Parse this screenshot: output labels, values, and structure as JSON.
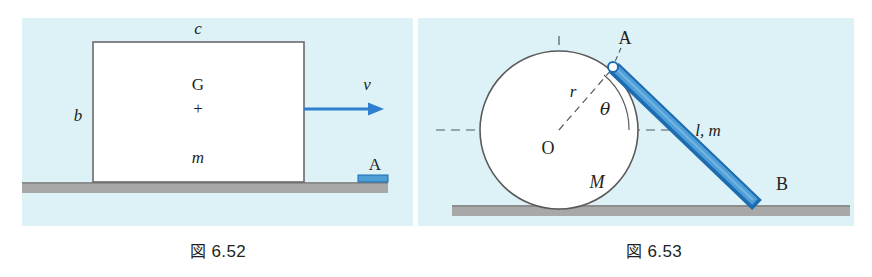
{
  "page": {
    "background_color": "#ffffff",
    "panel_background_color": "#ddf2f7",
    "ground_color": "#a8a8a8",
    "ground_edge_color": "#7d7d7d",
    "accent_blue": "#2e7fd0",
    "rod_blue_light": "#4e9fd8",
    "rod_blue_dark": "#1d6bb0",
    "outline_color": "#555555",
    "text_color": "#231f20"
  },
  "figures": [
    {
      "id": "figure-6-52",
      "caption_kanji": "図",
      "caption_number": "6.52",
      "description": "Rectangular block of mass m sliding on ground toward a small stop A",
      "labels": {
        "top_width": "c",
        "left_height": "b",
        "centroid": "G",
        "centroid_marker": "+",
        "mass": "m",
        "velocity": "v",
        "stop": "A"
      }
    },
    {
      "id": "figure-6-53",
      "caption_kanji": "図",
      "caption_number": "6.53",
      "description": "Circle of mass M resting on ground with a rod AB pinned at A on the circle, end B on the ground",
      "labels": {
        "pivot": "A",
        "center": "O",
        "radius": "r",
        "angle": "θ",
        "disk_mass": "M",
        "rod": "l, m",
        "rod_end": "B"
      }
    }
  ],
  "geometry": {
    "figure_6_52": {
      "block": {
        "x": 71,
        "y": 41,
        "width": 211,
        "height": 139
      },
      "arrow": {
        "x1": 282,
        "y1": 108,
        "x2": 352,
        "y2": 108
      },
      "stop_block": {
        "x": 357,
        "y": 174,
        "width": 29,
        "height": 7
      },
      "ground": {
        "x": 8,
        "y": 181,
        "width": 380,
        "height": 11
      }
    },
    "figure_6_53": {
      "circle": {
        "cx": 541,
        "cy": 130,
        "r": 79
      },
      "pivot": {
        "cx": 595,
        "cy": 68,
        "r": 5
      },
      "rod_end_b": {
        "x": 790,
        "y": 205
      },
      "ground": {
        "x": 452,
        "y": 205,
        "width": 398,
        "height": 11
      },
      "angle_degrees": 38
    }
  }
}
